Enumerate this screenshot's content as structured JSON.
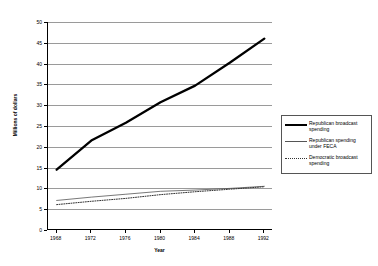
{
  "chart_data": {
    "type": "line",
    "title": "",
    "xlabel": "Year",
    "ylabel": "Millions of dollars",
    "x": [
      1968,
      1972,
      1976,
      1980,
      1984,
      1988,
      1992
    ],
    "xlim": [
      1967,
      1993
    ],
    "ylim": [
      0,
      50
    ],
    "y_ticks": [
      0,
      5,
      10,
      15,
      20,
      25,
      30,
      35,
      40,
      45,
      50
    ],
    "x_tick_labels": [
      "1968",
      "1972",
      "1976",
      "1980",
      "1984",
      "1988",
      "1992"
    ],
    "grid": "horizontal",
    "legend_position": "right",
    "series": [
      {
        "name": "Republican broadcast spending",
        "style": "thick-solid",
        "color": "#000000",
        "values": [
          14.5,
          21.5,
          25.8,
          30.7,
          34.7,
          40.2,
          46.0
        ]
      },
      {
        "name": "Republican spending under FECA",
        "style": "thin-solid",
        "color": "#555555",
        "values": [
          7.1,
          7.9,
          8.6,
          9.3,
          9.6,
          10.0,
          10.5
        ]
      },
      {
        "name": "Democratic broadcast spending",
        "style": "dotted",
        "color": "#333333",
        "values": [
          6.1,
          6.9,
          7.6,
          8.5,
          9.2,
          9.8,
          10.4
        ]
      }
    ]
  },
  "legend": {
    "entries": [
      {
        "label": "Republican broadcast spending"
      },
      {
        "label": "Republican spending under FECA"
      },
      {
        "label": "Democratic broadcast spending"
      }
    ]
  },
  "axes": {
    "y_label": "Millions of dollars",
    "x_label": "Year",
    "y_tick_labels": [
      "0",
      "5",
      "10",
      "15",
      "20",
      "25",
      "30",
      "35",
      "40",
      "45",
      "50"
    ],
    "x_tick_labels": [
      "1968",
      "1972",
      "1976",
      "1980",
      "1984",
      "1988",
      "1992"
    ]
  }
}
